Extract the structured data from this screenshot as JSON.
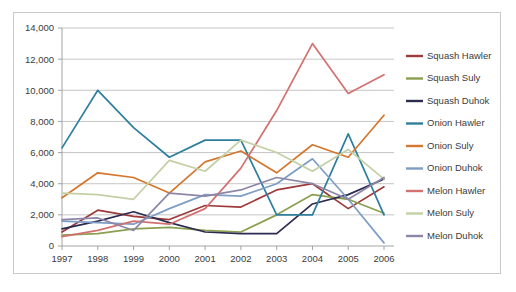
{
  "chart_data": {
    "type": "line",
    "title": "",
    "subtitle": "",
    "xlabel": "",
    "ylabel": "",
    "categories": [
      "1997",
      "1998",
      "1999",
      "2000",
      "2001",
      "2002",
      "2003",
      "2004",
      "2005",
      "2006"
    ],
    "ylim": [
      0,
      14000
    ],
    "ytick_step": 2000,
    "yticks": [
      "0",
      "2,000",
      "4,000",
      "6,000",
      "8,000",
      "10,000",
      "12,000",
      "14,000"
    ],
    "grid": "horizontal",
    "legend_position": "right",
    "series": [
      {
        "name": "Squash Hawler",
        "color": "#9e3a3a",
        "values": [
          900,
          2300,
          1900,
          1700,
          2600,
          2500,
          3600,
          4000,
          2400,
          3800
        ]
      },
      {
        "name": "Squash Suly",
        "color": "#8aa050",
        "values": [
          700,
          800,
          1100,
          1200,
          1000,
          900,
          2000,
          3300,
          3000,
          2100
        ]
      },
      {
        "name": "Squash Duhok",
        "color": "#2c2b50",
        "values": [
          1100,
          1600,
          2200,
          1500,
          900,
          800,
          800,
          2700,
          3300,
          4300
        ]
      },
      {
        "name": "Onion Hawler",
        "color": "#2e7f9e",
        "values": [
          6300,
          10000,
          7600,
          5700,
          6800,
          6800,
          2000,
          2000,
          7200,
          2000
        ]
      },
      {
        "name": "Onion Suly",
        "color": "#d4762c",
        "values": [
          3100,
          4700,
          4400,
          3400,
          5400,
          6100,
          4700,
          6500,
          5700,
          8400
        ]
      },
      {
        "name": "Onion Duhok",
        "color": "#7d9dc4",
        "values": [
          1600,
          1500,
          1400,
          2400,
          3300,
          3200,
          4000,
          5600,
          3000,
          200
        ]
      },
      {
        "name": "Melon Hawler",
        "color": "#d2716f",
        "values": [
          600,
          1000,
          1600,
          1400,
          2400,
          5000,
          8700,
          13000,
          9800,
          11000
        ]
      },
      {
        "name": "Melon Suly",
        "color": "#c3cfa4",
        "values": [
          3400,
          3300,
          3000,
          5500,
          4800,
          6800,
          6000,
          4800,
          6200,
          4300
        ]
      },
      {
        "name": "Melon Duhok",
        "color": "#8e86a6",
        "values": [
          1700,
          1800,
          1000,
          3400,
          3200,
          3600,
          4400,
          4000,
          3000,
          4400
        ]
      }
    ]
  },
  "axes": {
    "y_labels": [
      "14,000",
      "12,000",
      "10,000",
      "8,000",
      "6,000",
      "4,000",
      "2,000",
      "0"
    ],
    "x_labels": [
      "1997",
      "1998",
      "1999",
      "2000",
      "2001",
      "2002",
      "2003",
      "2004",
      "2005",
      "2006"
    ]
  },
  "legend": {
    "items": [
      {
        "label": "Squash Hawler",
        "color": "#9e3a3a"
      },
      {
        "label": "Squash Suly",
        "color": "#8aa050"
      },
      {
        "label": "Squash Duhok",
        "color": "#2c2b50"
      },
      {
        "label": "Onion Hawler",
        "color": "#2e7f9e"
      },
      {
        "label": "Onion Suly",
        "color": "#d4762c"
      },
      {
        "label": "Onion Duhok",
        "color": "#7d9dc4"
      },
      {
        "label": "Melon Hawler",
        "color": "#d2716f"
      },
      {
        "label": "Melon Suly",
        "color": "#c3cfa4"
      },
      {
        "label": "Melon Duhok",
        "color": "#8e86a6"
      }
    ]
  },
  "colors": {
    "background": "#ffffff",
    "border": "#c9c9c9",
    "gridline": "#b8b8b8",
    "axis": "#9a9a9a",
    "text": "#3b3b3b"
  }
}
